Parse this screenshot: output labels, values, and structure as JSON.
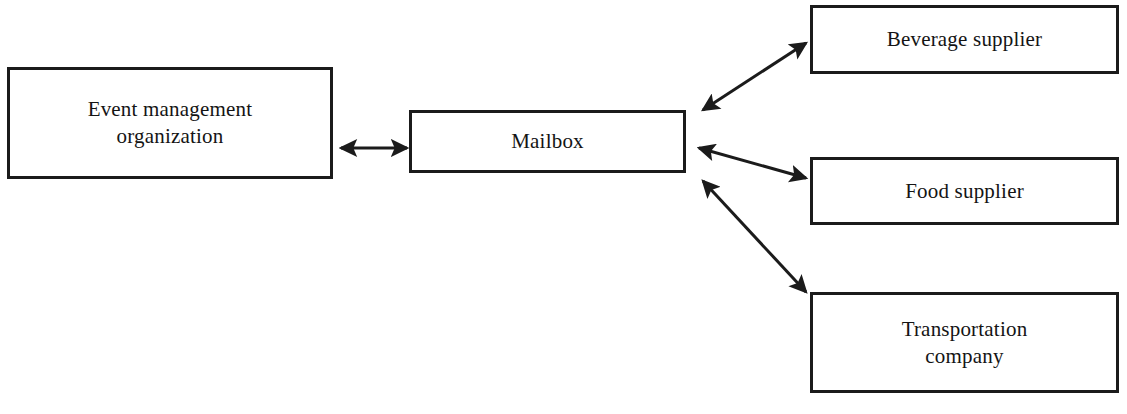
{
  "diagram": {
    "type": "block-diagram",
    "background_color": "#ffffff",
    "line_color": "#1b1b1b",
    "text_color": "#141414",
    "nodes": [
      {
        "id": "event",
        "label": "Event management\norganization",
        "shape": "rectangle"
      },
      {
        "id": "mailbox",
        "label": "Mailbox",
        "shape": "rectangle"
      },
      {
        "id": "beverage",
        "label": "Beverage supplier",
        "shape": "rectangle"
      },
      {
        "id": "food",
        "label": "Food supplier",
        "shape": "rectangle"
      },
      {
        "id": "transportation",
        "label": "Transportation\ncompany",
        "shape": "rectangle"
      }
    ],
    "connectors": [
      {
        "id": "event-mailbox",
        "from": "event",
        "to": "mailbox",
        "style": "double-headed-arrow",
        "x1": 341,
        "y1": 148,
        "x2": 407,
        "y2": 148
      },
      {
        "id": "mailbox-beverage",
        "from": "mailbox",
        "to": "beverage",
        "style": "double-headed-arrow",
        "x1": 703,
        "y1": 110,
        "x2": 806,
        "y2": 43
      },
      {
        "id": "mailbox-food",
        "from": "mailbox",
        "to": "food",
        "style": "double-headed-arrow",
        "x1": 699,
        "y1": 148,
        "x2": 806,
        "y2": 178
      },
      {
        "id": "mailbox-transportation",
        "from": "mailbox",
        "to": "transportation",
        "style": "double-headed-arrow",
        "x1": 703,
        "y1": 181,
        "x2": 806,
        "y2": 292
      }
    ]
  }
}
